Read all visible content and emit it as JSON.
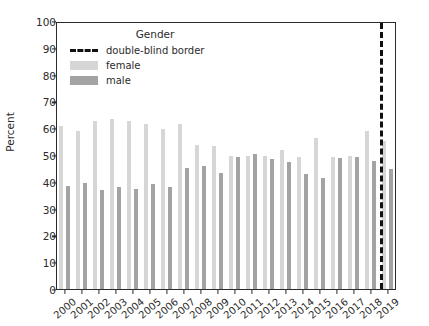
{
  "chart_data": {
    "type": "bar",
    "title": "",
    "xlabel": "",
    "ylabel": "Percent",
    "ylim": [
      0,
      100
    ],
    "yticks": [
      0,
      10,
      20,
      30,
      40,
      50,
      60,
      70,
      80,
      90,
      100
    ],
    "grid": false,
    "legend": {
      "title": "Gender",
      "position": "upper center",
      "entries": [
        {
          "label": "double-blind border",
          "style": "dashed-line",
          "color": "#111111"
        },
        {
          "label": "female",
          "style": "bar",
          "color": "#d6d6d6"
        },
        {
          "label": "male",
          "style": "bar",
          "color": "#a3a3a3"
        }
      ]
    },
    "categories": [
      "2000",
      "2001",
      "2002",
      "2003",
      "2004",
      "2005",
      "2006",
      "2007",
      "2008",
      "2009",
      "2010",
      "2011",
      "2012",
      "2013",
      "2014",
      "2015",
      "2016",
      "2017",
      "2018",
      "2019"
    ],
    "series": [
      {
        "name": "female",
        "color": "#d6d6d6",
        "values": [
          60.7,
          58.8,
          62.7,
          63.6,
          62.6,
          61.6,
          59.6,
          61.6,
          53.8,
          53.2,
          49.8,
          49.8,
          49.6,
          51.8,
          49.2,
          56.2,
          49.3,
          49.6,
          59.0,
          55.1
        ]
      },
      {
        "name": "male",
        "color": "#a3a3a3",
        "values": [
          38.6,
          39.4,
          36.8,
          38.2,
          37.2,
          39.0,
          38.0,
          45.3,
          45.8,
          43.4,
          49.4,
          50.3,
          48.5,
          47.3,
          43.0,
          41.4,
          48.9,
          49.2,
          47.9,
          44.8
        ]
      }
    ],
    "annotations": [
      {
        "type": "vline",
        "label": "double-blind border",
        "x_position": "between 2018 and 2019",
        "style": "dashed",
        "color": "#111111"
      }
    ]
  }
}
